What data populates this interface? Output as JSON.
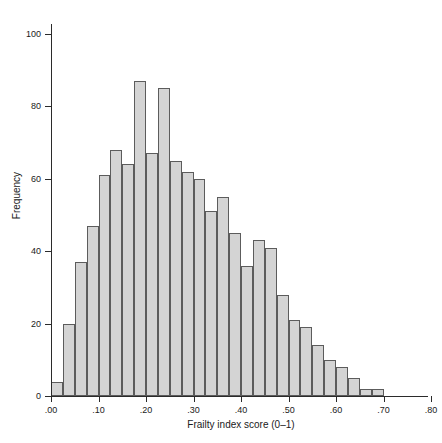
{
  "chart_data": {
    "type": "bar",
    "title": "",
    "xlabel": "Frailty index score (0–1)",
    "ylabel": "Frequency",
    "xlim": [
      0.0,
      0.8
    ],
    "ylim": [
      0,
      100
    ],
    "grid": false,
    "legend": "none",
    "bin_width": 0.025,
    "xticks": [
      0.0,
      0.1,
      0.2,
      0.3,
      0.4,
      0.5,
      0.6,
      0.7,
      0.8
    ],
    "xtick_labels": [
      ".00",
      ".10",
      ".20",
      ".30",
      ".40",
      ".50",
      ".60",
      ".70",
      ".80"
    ],
    "yticks": [
      0,
      20,
      40,
      60,
      80,
      100
    ],
    "ytick_labels": [
      "0",
      "20",
      "40",
      "60",
      "80",
      "100"
    ],
    "bar_fill_color": "#d4d4d4",
    "bar_edge_color": "#5c5c5c",
    "axis_color": "#2b2b2b",
    "background_color": "#ffffff",
    "bins": [
      {
        "x0": 0.0,
        "x1": 0.025,
        "value": 4
      },
      {
        "x0": 0.025,
        "x1": 0.05,
        "value": 20
      },
      {
        "x0": 0.05,
        "x1": 0.075,
        "value": 37
      },
      {
        "x0": 0.075,
        "x1": 0.1,
        "value": 47
      },
      {
        "x0": 0.1,
        "x1": 0.125,
        "value": 61
      },
      {
        "x0": 0.125,
        "x1": 0.15,
        "value": 68
      },
      {
        "x0": 0.15,
        "x1": 0.175,
        "value": 64
      },
      {
        "x0": 0.175,
        "x1": 0.2,
        "value": 87
      },
      {
        "x0": 0.2,
        "x1": 0.225,
        "value": 67
      },
      {
        "x0": 0.225,
        "x1": 0.25,
        "value": 85
      },
      {
        "x0": 0.25,
        "x1": 0.275,
        "value": 65
      },
      {
        "x0": 0.275,
        "x1": 0.3,
        "value": 62
      },
      {
        "x0": 0.3,
        "x1": 0.325,
        "value": 60
      },
      {
        "x0": 0.325,
        "x1": 0.35,
        "value": 51
      },
      {
        "x0": 0.35,
        "x1": 0.375,
        "value": 55
      },
      {
        "x0": 0.375,
        "x1": 0.4,
        "value": 45
      },
      {
        "x0": 0.4,
        "x1": 0.425,
        "value": 36
      },
      {
        "x0": 0.425,
        "x1": 0.45,
        "value": 43
      },
      {
        "x0": 0.45,
        "x1": 0.475,
        "value": 41
      },
      {
        "x0": 0.475,
        "x1": 0.5,
        "value": 28
      },
      {
        "x0": 0.5,
        "x1": 0.525,
        "value": 21
      },
      {
        "x0": 0.525,
        "x1": 0.55,
        "value": 19
      },
      {
        "x0": 0.55,
        "x1": 0.575,
        "value": 14
      },
      {
        "x0": 0.575,
        "x1": 0.6,
        "value": 10
      },
      {
        "x0": 0.6,
        "x1": 0.625,
        "value": 8
      },
      {
        "x0": 0.625,
        "x1": 0.65,
        "value": 5
      },
      {
        "x0": 0.65,
        "x1": 0.675,
        "value": 2
      },
      {
        "x0": 0.675,
        "x1": 0.7,
        "value": 2
      }
    ]
  }
}
